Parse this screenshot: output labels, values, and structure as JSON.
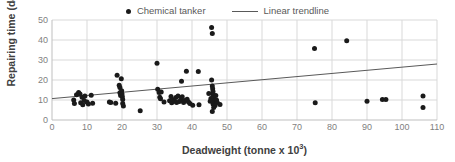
{
  "chart_data": {
    "type": "scatter",
    "title": "",
    "xlabel": "Deadweight (tonne x 10³)",
    "xlabel_base": "Deadweight (tonne x 10",
    "xlabel_sup": "3",
    "xlabel_tail": ")",
    "ylabel": "Repairing time (day)",
    "xlim": [
      0,
      110
    ],
    "ylim": [
      0,
      50
    ],
    "xticks": [
      0,
      10,
      20,
      30,
      40,
      50,
      60,
      70,
      80,
      90,
      100,
      110
    ],
    "yticks": [
      0,
      10,
      20,
      30,
      40,
      50
    ],
    "grid": true,
    "legend_position": "top-center",
    "marker_color": "#1a1a1a",
    "trendline_color": "#595959",
    "gridline_color": "#d9d9d9",
    "axis_text_color": "#7f7f7f",
    "axis_title_color": "#404040",
    "series": [
      {
        "name": "Chemical tanker",
        "type": "scatter",
        "points": [
          [
            6.2,
            10.0
          ],
          [
            6.4,
            8.2
          ],
          [
            7.0,
            12.6
          ],
          [
            7.6,
            13.8
          ],
          [
            8.0,
            13.0
          ],
          [
            8.2,
            8.6
          ],
          [
            8.6,
            11.4
          ],
          [
            8.8,
            7.6
          ],
          [
            9.2,
            9.8
          ],
          [
            9.4,
            12.0
          ],
          [
            10.0,
            9.0
          ],
          [
            10.4,
            8.0
          ],
          [
            11.2,
            12.4
          ],
          [
            11.6,
            8.4
          ],
          [
            16.4,
            9.0
          ],
          [
            16.8,
            8.8
          ],
          [
            18.6,
            22.4
          ],
          [
            19.2,
            17.4
          ],
          [
            19.4,
            16.2
          ],
          [
            19.4,
            13.6
          ],
          [
            19.6,
            12.2
          ],
          [
            19.8,
            20.6
          ],
          [
            19.9,
            14.6
          ],
          [
            20.0,
            13.0
          ],
          [
            20.1,
            11.6
          ],
          [
            20.2,
            10.2
          ],
          [
            20.2,
            8.2
          ],
          [
            20.4,
            7.0
          ],
          [
            18.2,
            8.4
          ],
          [
            25.2,
            4.6
          ],
          [
            30.0,
            28.4
          ],
          [
            30.2,
            15.4
          ],
          [
            30.6,
            13.8
          ],
          [
            30.8,
            11.4
          ],
          [
            31.0,
            10.6
          ],
          [
            31.2,
            14.0
          ],
          [
            32.0,
            9.0
          ],
          [
            33.6,
            9.6
          ],
          [
            34.0,
            11.8
          ],
          [
            34.2,
            8.6
          ],
          [
            34.4,
            10.2
          ],
          [
            35.0,
            9.4
          ],
          [
            35.4,
            11.2
          ],
          [
            35.6,
            8.8
          ],
          [
            36.0,
            12.0
          ],
          [
            36.4,
            9.2
          ],
          [
            36.8,
            10.0
          ],
          [
            37.0,
            19.4
          ],
          [
            37.2,
            11.6
          ],
          [
            37.6,
            8.8
          ],
          [
            38.0,
            9.8
          ],
          [
            38.4,
            24.4
          ],
          [
            38.6,
            10.4
          ],
          [
            39.0,
            9.0
          ],
          [
            39.4,
            8.2
          ],
          [
            40.2,
            7.4
          ],
          [
            41.8,
            24.2
          ],
          [
            42.0,
            7.6
          ],
          [
            45.6,
            46.2
          ],
          [
            45.8,
            43.2
          ],
          [
            45.6,
            20.0
          ],
          [
            45.8,
            17.0
          ],
          [
            45.9,
            15.6
          ],
          [
            46.0,
            14.2
          ],
          [
            46.0,
            12.8
          ],
          [
            46.1,
            11.8
          ],
          [
            46.2,
            11.0
          ],
          [
            46.3,
            10.4
          ],
          [
            46.4,
            9.8
          ],
          [
            46.5,
            9.2
          ],
          [
            46.6,
            8.6
          ],
          [
            46.0,
            8.0
          ],
          [
            45.4,
            10.8
          ],
          [
            45.2,
            9.4
          ],
          [
            46.8,
            12.2
          ],
          [
            47.0,
            10.0
          ],
          [
            47.2,
            8.8
          ],
          [
            46.6,
            7.2
          ],
          [
            46.2,
            6.2
          ],
          [
            45.8,
            4.2
          ],
          [
            48.0,
            7.8
          ],
          [
            44.8,
            13.2
          ],
          [
            75.0,
            35.8
          ],
          [
            75.2,
            8.6
          ],
          [
            84.2,
            39.6
          ],
          [
            90.0,
            9.4
          ],
          [
            94.4,
            10.2
          ],
          [
            95.4,
            10.2
          ],
          [
            106.0,
            12.0
          ],
          [
            106.0,
            6.2
          ]
        ]
      },
      {
        "name": "Linear trendline",
        "type": "line",
        "x_start": 0,
        "y_start": 10.7,
        "x_end": 110,
        "y_end": 28.0
      }
    ],
    "legend": [
      {
        "label": "Chemical tanker",
        "marker": "dot"
      },
      {
        "label": "Linear trendline",
        "marker": "line"
      }
    ]
  }
}
